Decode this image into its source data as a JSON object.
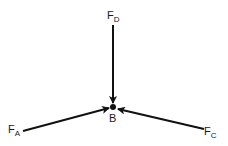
{
  "diagram": {
    "type": "free-body-diagram",
    "point": {
      "label": "B"
    },
    "forces": [
      {
        "id": "FD",
        "symbol": "F",
        "subscript": "D",
        "direction": "downward into B"
      },
      {
        "id": "FA",
        "symbol": "F",
        "subscript": "A",
        "direction": "from lower-left into B"
      },
      {
        "id": "FC",
        "symbol": "F",
        "subscript": "C",
        "direction": "from lower-right into B"
      }
    ],
    "colors": {
      "line": "#111111",
      "background": "#ffffff"
    }
  }
}
